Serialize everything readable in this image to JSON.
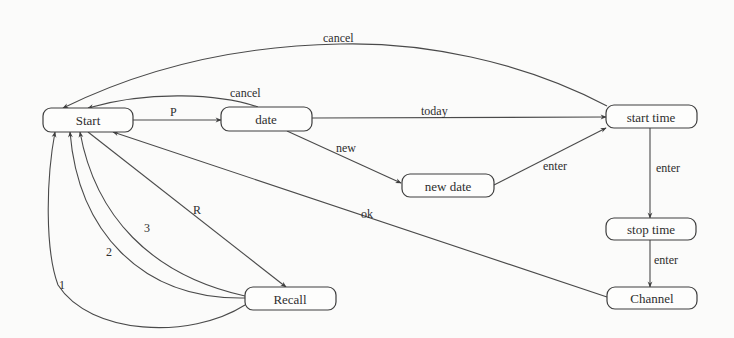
{
  "diagram": {
    "type": "state-transition-diagram",
    "colors": {
      "background": "#fbfbfa",
      "line": "#4a4a4a",
      "text": "#2e2e2e"
    },
    "nodes": [
      {
        "id": "start",
        "label": "Start",
        "x": 43,
        "y": 108,
        "w": 90,
        "h": 24
      },
      {
        "id": "date",
        "label": "date",
        "x": 221,
        "y": 107,
        "w": 91,
        "h": 24
      },
      {
        "id": "start_time",
        "label": "start time",
        "x": 606,
        "y": 105,
        "w": 91,
        "h": 23
      },
      {
        "id": "new_date",
        "label": "new date",
        "x": 402,
        "y": 174,
        "w": 92,
        "h": 23
      },
      {
        "id": "stop_time",
        "label": "stop time",
        "x": 606,
        "y": 218,
        "w": 90,
        "h": 22
      },
      {
        "id": "recall",
        "label": "Recall",
        "x": 245,
        "y": 287,
        "w": 91,
        "h": 23
      },
      {
        "id": "channel",
        "label": "Channel",
        "x": 607,
        "y": 287,
        "w": 90,
        "h": 22
      }
    ],
    "edges": [
      {
        "from": "start",
        "to": "date",
        "label": "P"
      },
      {
        "from": "date",
        "to": "start",
        "label": "cancel"
      },
      {
        "from": "start_time",
        "to": "start",
        "label": "cancel"
      },
      {
        "from": "date",
        "to": "start_time",
        "label": "today"
      },
      {
        "from": "date",
        "to": "new_date",
        "label": "new"
      },
      {
        "from": "new_date",
        "to": "start_time",
        "label": "enter"
      },
      {
        "from": "start_time",
        "to": "stop_time",
        "label": "enter"
      },
      {
        "from": "stop_time",
        "to": "channel",
        "label": "enter"
      },
      {
        "from": "channel",
        "to": "start",
        "label": "ok"
      },
      {
        "from": "start",
        "to": "recall",
        "label": "R"
      },
      {
        "from": "recall",
        "to": "start",
        "label": "1"
      },
      {
        "from": "recall",
        "to": "start",
        "label": "2"
      },
      {
        "from": "recall",
        "to": "start",
        "label": "3"
      }
    ]
  }
}
